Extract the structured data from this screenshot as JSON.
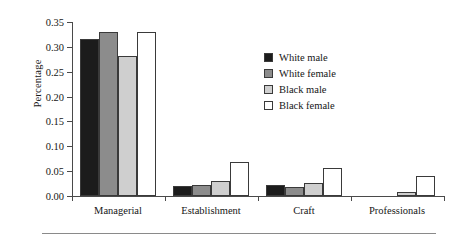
{
  "chart_data": {
    "type": "bar",
    "title": "",
    "xlabel": "",
    "ylabel": "Percentage",
    "ylim": [
      0,
      0.35
    ],
    "yticks": [
      "0.00",
      "0.05",
      "0.10",
      "0.15",
      "0.20",
      "0.25",
      "0.30",
      "0.35"
    ],
    "ytick_values": [
      0,
      0.05,
      0.1,
      0.15,
      0.2,
      0.25,
      0.3,
      0.35
    ],
    "grid": false,
    "legend_position": "upper right inside",
    "categories": [
      "Managerial",
      "Establishment",
      "Craft",
      "Professionals"
    ],
    "series": [
      {
        "name": "White male",
        "color": "#1c1c1c",
        "values": [
          0.315,
          0.02,
          0.022,
          0.0
        ]
      },
      {
        "name": "White female",
        "color": "#8c8c8c",
        "values": [
          0.33,
          0.022,
          0.018,
          0.0
        ]
      },
      {
        "name": "Black male",
        "color": "#cfcfcf",
        "values": [
          0.282,
          0.03,
          0.027,
          0.009
        ]
      },
      {
        "name": "Black female",
        "color": "#ffffff",
        "values": [
          0.33,
          0.068,
          0.057,
          0.041
        ]
      }
    ]
  },
  "axis": {
    "line_color": "#4a4a4a",
    "bar_edge_color": "#3a3a3a"
  }
}
